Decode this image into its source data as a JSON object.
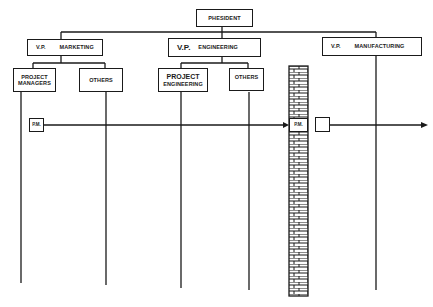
{
  "diagram": {
    "colors": {
      "line": "#1a1a1a",
      "background": "#ffffff",
      "brick": "#1a1a1a"
    },
    "president": {
      "label": "PHESIDENT"
    },
    "vps": [
      {
        "prefix": "V.P.",
        "dept": "MARKETING"
      },
      {
        "prefix": "V.P.",
        "dept": "ENGINEERING"
      },
      {
        "prefix": "V.P.",
        "dept": "MANUFACTURING"
      }
    ],
    "sub_units": [
      {
        "line1": "PROJECT",
        "line2": "MANAGERS",
        "parent": "MARKETING"
      },
      {
        "line1": "OTHERS",
        "line2": "",
        "parent": "MARKETING"
      },
      {
        "line1": "PROJECT",
        "line2": "ENGINEERING",
        "parent": "ENGINEERING"
      },
      {
        "line1": "OTHERS",
        "line2": "",
        "parent": "ENGINEERING"
      }
    ],
    "flow": {
      "start_box": "P.M.",
      "wall_label_box": "P.M.",
      "end_box": "",
      "arrow_direction": "right"
    },
    "wall": {
      "type": "brick-wall",
      "description": "barrier between engineering and manufacturing"
    }
  }
}
